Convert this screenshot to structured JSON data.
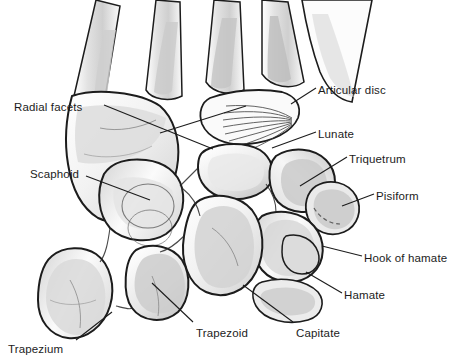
{
  "figure": {
    "kind": "anatomical-illustration",
    "background_color": "#ffffff",
    "ink_color": "#1c1c1c",
    "shading_colors": [
      "#e9e9e9",
      "#d8d8d8",
      "#c6c6c6",
      "#b4b4b4"
    ]
  },
  "labels": [
    {
      "id": "radial-facets",
      "text": "Radial facets",
      "x": 14,
      "y": 101,
      "anchor": "start"
    },
    {
      "id": "scaphoid",
      "text": "Scaphoid",
      "x": 30,
      "y": 168,
      "anchor": "start"
    },
    {
      "id": "trapezium",
      "text": "Trapezium",
      "x": 8,
      "y": 343,
      "anchor": "start"
    },
    {
      "id": "trapezoid",
      "text": "Trapezoid",
      "x": 196,
      "y": 327,
      "anchor": "start"
    },
    {
      "id": "capitate",
      "text": "Capitate",
      "x": 296,
      "y": 327,
      "anchor": "start"
    },
    {
      "id": "articular-disc",
      "text": "Articular disc",
      "x": 318,
      "y": 84,
      "anchor": "start"
    },
    {
      "id": "lunate",
      "text": "Lunate",
      "x": 318,
      "y": 128,
      "anchor": "start"
    },
    {
      "id": "triquetrum",
      "text": "Triquetrum",
      "x": 349,
      "y": 153,
      "anchor": "start"
    },
    {
      "id": "pisiform",
      "text": "Pisiform",
      "x": 376,
      "y": 190,
      "anchor": "start"
    },
    {
      "id": "hook-of-hamate",
      "text": "Hook of hamate",
      "x": 364,
      "y": 252,
      "anchor": "start"
    },
    {
      "id": "hamate",
      "text": "Hamate",
      "x": 344,
      "y": 289,
      "anchor": "start"
    }
  ],
  "leader_lines": [
    {
      "id": "leader-radial-facets",
      "from": [
        104,
        105
      ],
      "to": [
        213,
        149
      ]
    },
    {
      "id": "leader-radial-facets-2",
      "from": [
        160,
        133
      ],
      "to": [
        246,
        106
      ]
    },
    {
      "id": "leader-scaphoid",
      "from": [
        86,
        176
      ],
      "to": [
        150,
        200
      ]
    },
    {
      "id": "leader-trapezium",
      "from": [
        76,
        340
      ],
      "to": [
        112,
        312
      ]
    },
    {
      "id": "leader-trapezoid",
      "from": [
        193,
        322
      ],
      "to": [
        152,
        283
      ]
    },
    {
      "id": "leader-capitate",
      "from": [
        293,
        322
      ],
      "to": [
        243,
        285
      ]
    },
    {
      "id": "leader-articular-disc",
      "from": [
        316,
        88
      ],
      "to": [
        291,
        104
      ]
    },
    {
      "id": "leader-lunate",
      "from": [
        316,
        132
      ],
      "to": [
        272,
        148
      ]
    },
    {
      "id": "leader-triquetrum",
      "from": [
        347,
        157
      ],
      "to": [
        300,
        186
      ]
    },
    {
      "id": "leader-pisiform",
      "from": [
        374,
        194
      ],
      "to": [
        342,
        206
      ]
    },
    {
      "id": "leader-hook-of-hamate",
      "from": [
        362,
        256
      ],
      "to": [
        322,
        246
      ]
    },
    {
      "id": "leader-hamate",
      "from": [
        342,
        293
      ],
      "to": [
        306,
        272
      ]
    }
  ],
  "structures": [
    {
      "id": "metacarpal-1",
      "name": "Metacarpal bone (first)"
    },
    {
      "id": "metacarpal-2",
      "name": "Metacarpal bone (second)"
    },
    {
      "id": "metacarpal-3",
      "name": "Metacarpal bone (third)"
    },
    {
      "id": "metacarpal-4",
      "name": "Metacarpal bone (fourth)"
    },
    {
      "id": "radius",
      "name": "Distal radius"
    },
    {
      "id": "ulna",
      "name": "Distal ulna"
    },
    {
      "id": "articular-disc",
      "name": "Articular disc"
    },
    {
      "id": "scaphoid",
      "name": "Scaphoid"
    },
    {
      "id": "lunate",
      "name": "Lunate"
    },
    {
      "id": "triquetrum",
      "name": "Triquetrum"
    },
    {
      "id": "pisiform",
      "name": "Pisiform"
    },
    {
      "id": "trapezium",
      "name": "Trapezium"
    },
    {
      "id": "trapezoid",
      "name": "Trapezoid"
    },
    {
      "id": "capitate",
      "name": "Capitate"
    },
    {
      "id": "hamate",
      "name": "Hamate"
    },
    {
      "id": "hook-of-hamate",
      "name": "Hook of hamate"
    }
  ]
}
